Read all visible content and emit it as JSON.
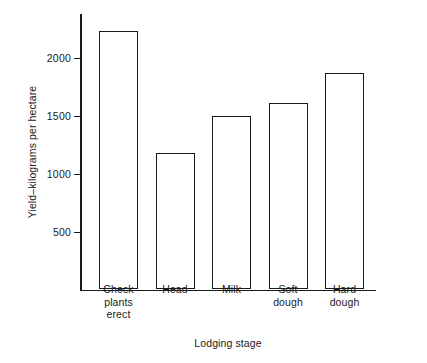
{
  "chart_data": {
    "type": "bar",
    "title": "",
    "xlabel": "Lodging stage",
    "ylabel": "Yield–kilograms per hectare",
    "categories": [
      "Check\nplants\nerect",
      "Head",
      "Milk",
      "Soft\ndough",
      "Hard\ndough"
    ],
    "values": [
      2225,
      1180,
      1495,
      1605,
      1865
    ],
    "ylim": [
      0,
      2400
    ],
    "yticks": [
      500,
      1000,
      1500,
      2000
    ],
    "ytick_labels": [
      "500",
      "1000",
      "1500",
      "2000"
    ],
    "grid": false,
    "legend": false,
    "bar_fill_color": "#ffffff",
    "bar_edge_color": "#1a1a1a",
    "axis_color": "#1a1a1a",
    "background_color": "#ffffff"
  }
}
